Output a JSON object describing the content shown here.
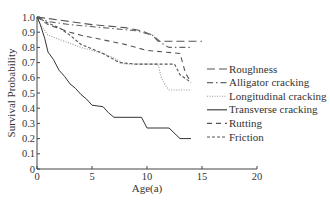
{
  "chart_data": {
    "type": "line",
    "title": "",
    "xlabel": "Age(a)",
    "ylabel": "Survival Probability",
    "xlim": [
      0,
      20
    ],
    "ylim": [
      0,
      1.0
    ],
    "x_ticks": [
      "0",
      "5",
      "10",
      "15",
      "20"
    ],
    "y_ticks": [
      "0",
      "0.1",
      "0.2",
      "0.3",
      "0.4",
      "0.5",
      "0.6",
      "0.7",
      "0.8",
      "0.9",
      "1.0"
    ],
    "grid": false,
    "legend_position": "right-inside",
    "step_curves": true,
    "series": [
      {
        "name": "Roughness",
        "style": "long-dash",
        "color": "#555555",
        "points": [
          [
            0,
            1.0
          ],
          [
            1,
            0.99
          ],
          [
            3,
            0.97
          ],
          [
            5,
            0.95
          ],
          [
            8,
            0.93
          ],
          [
            9.5,
            0.91
          ],
          [
            10.5,
            0.88
          ],
          [
            11,
            0.84
          ],
          [
            15,
            0.84
          ]
        ]
      },
      {
        "name": "Alligator cracking",
        "style": "dash-dot",
        "color": "#666666",
        "points": [
          [
            0,
            1.0
          ],
          [
            1,
            0.97
          ],
          [
            3,
            0.95
          ],
          [
            6,
            0.93
          ],
          [
            9,
            0.91
          ],
          [
            10.5,
            0.88
          ],
          [
            11.5,
            0.82
          ],
          [
            12,
            0.8
          ],
          [
            14,
            0.8
          ]
        ]
      },
      {
        "name": "Longitudinal cracking",
        "style": "dotted",
        "color": "#999999",
        "points": [
          [
            0,
            1.0
          ],
          [
            0.5,
            0.93
          ],
          [
            1,
            0.88
          ],
          [
            2.5,
            0.84
          ],
          [
            4,
            0.8
          ],
          [
            6,
            0.76
          ],
          [
            7,
            0.73
          ],
          [
            8,
            0.69
          ],
          [
            11,
            0.69
          ],
          [
            11.3,
            0.6
          ],
          [
            11.6,
            0.56
          ],
          [
            12,
            0.52
          ],
          [
            14,
            0.52
          ]
        ]
      },
      {
        "name": "Transverse cracking",
        "style": "solid",
        "color": "#333333",
        "points": [
          [
            0,
            1.0
          ],
          [
            0.3,
            0.95
          ],
          [
            0.7,
            0.86
          ],
          [
            1,
            0.77
          ],
          [
            1.5,
            0.72
          ],
          [
            2,
            0.65
          ],
          [
            2.5,
            0.61
          ],
          [
            3,
            0.56
          ],
          [
            3.5,
            0.53
          ],
          [
            4,
            0.49
          ],
          [
            4.5,
            0.46
          ],
          [
            5,
            0.42
          ],
          [
            6,
            0.41
          ],
          [
            6.5,
            0.37
          ],
          [
            7,
            0.34
          ],
          [
            9.5,
            0.34
          ],
          [
            10,
            0.27
          ],
          [
            12,
            0.27
          ],
          [
            13,
            0.2
          ],
          [
            14,
            0.2
          ]
        ]
      },
      {
        "name": "Rutting",
        "style": "dash",
        "color": "#555555",
        "points": [
          [
            0,
            1.0
          ],
          [
            1,
            0.95
          ],
          [
            3,
            0.9
          ],
          [
            4,
            0.88
          ],
          [
            6,
            0.85
          ],
          [
            8,
            0.82
          ],
          [
            9,
            0.8
          ],
          [
            10,
            0.78
          ],
          [
            13,
            0.76
          ],
          [
            13.5,
            0.63
          ],
          [
            14,
            0.57
          ]
        ]
      },
      {
        "name": "Friction",
        "style": "short-dash",
        "color": "#555555",
        "points": [
          [
            0,
            1.0
          ],
          [
            1,
            0.96
          ],
          [
            2,
            0.93
          ],
          [
            3,
            0.88
          ],
          [
            4,
            0.82
          ],
          [
            5,
            0.79
          ],
          [
            6,
            0.76
          ],
          [
            7,
            0.72
          ],
          [
            7.5,
            0.7
          ],
          [
            9,
            0.69
          ],
          [
            12.5,
            0.69
          ],
          [
            13,
            0.62
          ],
          [
            14,
            0.57
          ]
        ]
      }
    ]
  }
}
